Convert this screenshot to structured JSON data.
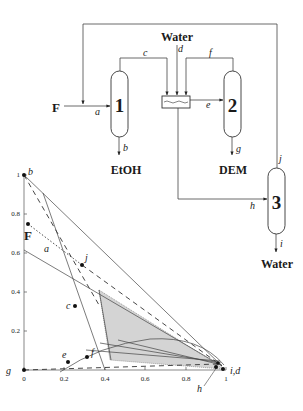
{
  "flowsheet": {
    "feed_label": "F",
    "water_in_label": "Water",
    "units": [
      {
        "id": "1",
        "label": "1"
      },
      {
        "id": "2",
        "label": "2"
      },
      {
        "id": "3",
        "label": "3"
      }
    ],
    "decanter": "decanter",
    "products": {
      "etoh": "EtOH",
      "dem": "DEM",
      "water": "Water"
    },
    "streams": {
      "a": "a",
      "b": "b",
      "c": "c",
      "d": "d",
      "e": "e",
      "f": "f",
      "g": "g",
      "h": "h",
      "i": "i",
      "j": "j"
    }
  },
  "ternary": {
    "x_ticks": [
      "0",
      "0.2",
      "0.4",
      "0.6",
      "0.8",
      "1"
    ],
    "y_ticks": [
      "0.2",
      "0.4",
      "0.6",
      "0.8",
      "1"
    ],
    "point_labels": {
      "b": "b",
      "F": "F",
      "a": "a",
      "j": "j",
      "c": "c",
      "e": "e",
      "f": "f",
      "g": "g",
      "id": "i,d",
      "h": "h"
    }
  }
}
